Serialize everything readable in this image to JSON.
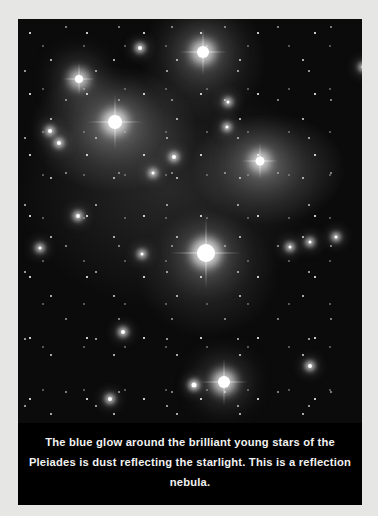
{
  "figure": {
    "photo_bg_color": "#0b0b0b",
    "page_bg_color": "#e6e6e4",
    "caption_bg_color": "#000000",
    "caption_text_color": "#f2f2f2",
    "caption": "The blue glow around the brilliant young stars of the Pleiades is dust reflecting the starlight. This is a reflection nebula."
  },
  "stars": [
    {
      "x": 185,
      "y": 33,
      "size": 12,
      "kind": "big"
    },
    {
      "x": 61,
      "y": 60,
      "size": 8,
      "kind": "big"
    },
    {
      "x": 97,
      "y": 103,
      "size": 14,
      "kind": "big"
    },
    {
      "x": 242,
      "y": 142,
      "size": 9,
      "kind": "big"
    },
    {
      "x": 188,
      "y": 234,
      "size": 18,
      "kind": "big"
    },
    {
      "x": 206,
      "y": 363,
      "size": 12,
      "kind": "big"
    },
    {
      "x": 122,
      "y": 29,
      "size": 4,
      "kind": "med"
    },
    {
      "x": 32,
      "y": 112,
      "size": 4,
      "kind": "med"
    },
    {
      "x": 41,
      "y": 124,
      "size": 4,
      "kind": "med"
    },
    {
      "x": 156,
      "y": 138,
      "size": 4,
      "kind": "med"
    },
    {
      "x": 135,
      "y": 154,
      "size": 3,
      "kind": "med"
    },
    {
      "x": 60,
      "y": 197,
      "size": 4,
      "kind": "med"
    },
    {
      "x": 22,
      "y": 229,
      "size": 3,
      "kind": "med"
    },
    {
      "x": 124,
      "y": 235,
      "size": 3,
      "kind": "med"
    },
    {
      "x": 272,
      "y": 228,
      "size": 3,
      "kind": "med"
    },
    {
      "x": 292,
      "y": 223,
      "size": 3,
      "kind": "med"
    },
    {
      "x": 318,
      "y": 218,
      "size": 3,
      "kind": "med"
    },
    {
      "x": 105,
      "y": 313,
      "size": 4,
      "kind": "med"
    },
    {
      "x": 176,
      "y": 366,
      "size": 5,
      "kind": "med"
    },
    {
      "x": 292,
      "y": 347,
      "size": 4,
      "kind": "med"
    },
    {
      "x": 92,
      "y": 380,
      "size": 4,
      "kind": "med"
    },
    {
      "x": 345,
      "y": 48,
      "size": 3,
      "kind": "med"
    },
    {
      "x": 210,
      "y": 83,
      "size": 3,
      "kind": "med"
    },
    {
      "x": 209,
      "y": 108,
      "size": 3,
      "kind": "med"
    }
  ]
}
